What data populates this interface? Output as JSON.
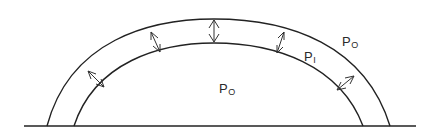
{
  "diagram": {
    "stroke_color": "#222222",
    "background": "#ffffff",
    "labels": {
      "outside_pressure": {
        "main": "P",
        "sub": "O"
      },
      "wall_pressure": {
        "main": "P",
        "sub": "I"
      },
      "inside_pressure": {
        "main": "P",
        "sub": "O"
      }
    },
    "arrows_count": 5
  }
}
